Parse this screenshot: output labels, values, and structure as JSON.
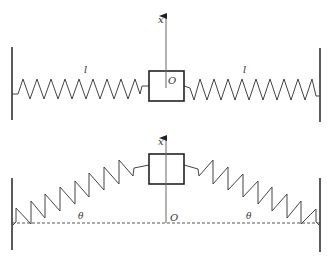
{
  "figure": {
    "top_panel": {
      "axis_label": "x",
      "origin_label": "O",
      "left_spring_label": "l",
      "right_spring_label": "l"
    },
    "bottom_panel": {
      "axis_label": "x",
      "origin_label": "O",
      "left_angle_label": "θ",
      "right_angle_label": "θ"
    }
  },
  "colors": {
    "line": "#333333",
    "axis": "#555555"
  }
}
